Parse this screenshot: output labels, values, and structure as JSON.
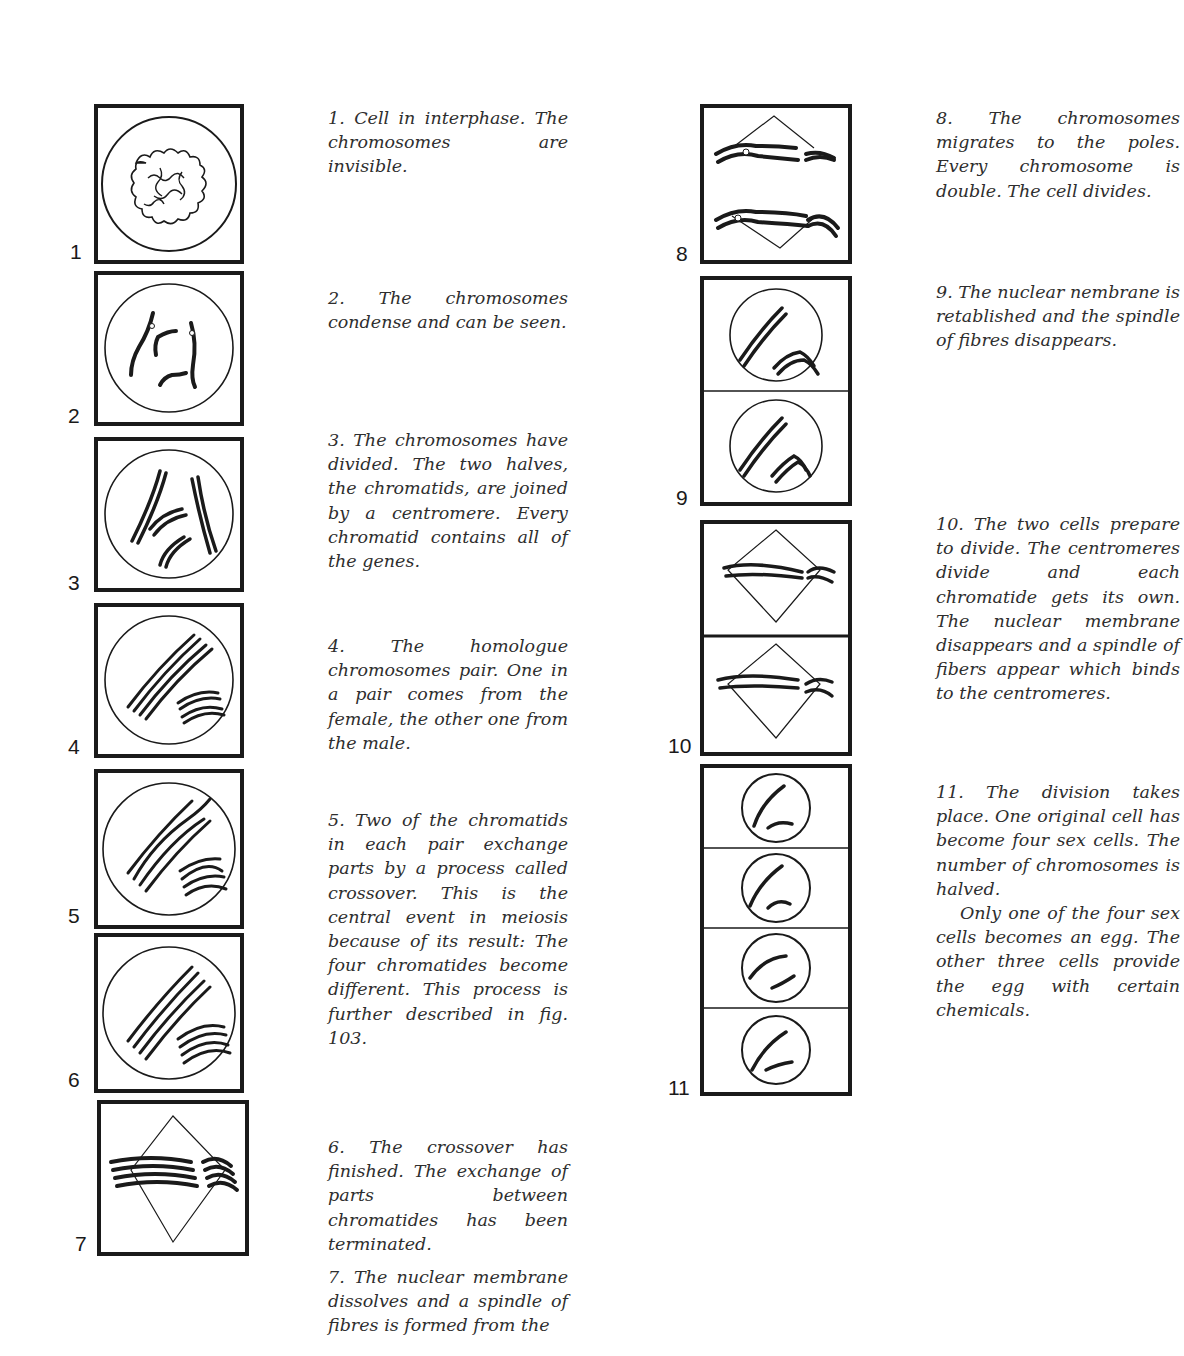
{
  "figure": {
    "stages": [
      {
        "number": "1",
        "caption": "1. Cell in interphase. The chromosomes are invisible."
      },
      {
        "number": "2",
        "caption": "2. The chromosomes condense and can be seen."
      },
      {
        "number": "3",
        "caption": "3. The chromosomes have divided. The two halves, the chromatids, are joined by a centromere. Every chromatid contains all of the genes."
      },
      {
        "number": "4",
        "caption": "4. The homologue chromosomes pair. One in a pair comes from the female, the other one from the male."
      },
      {
        "number": "5",
        "caption": "5. Two of the chromatids in each pair exchange parts by a process called crossover. This is the central event in meiosis because of its result: The four chromatides become different. This process is further described in fig. 103."
      },
      {
        "number": "6",
        "caption": "6. The crossover has finished. The exchange of parts between chromatides has been terminated."
      },
      {
        "number": "7",
        "caption": "7. The nuclear membrane dissolves and a spindle of fibres is formed from the"
      },
      {
        "number": "8",
        "caption": "8. The chromosomes migrates to the poles. Every chromosome is double. The cell divides."
      },
      {
        "number": "9",
        "caption": "9. The nuclear nembrane is retablished and the spindle of fibres disappears."
      },
      {
        "number": "10",
        "caption": "10. The two cells prepare to divide. The centromeres divide and each chromatide gets its own. The nuclear membrane disappears and a spindle of fibers appear which binds to the centromeres."
      },
      {
        "number": "11",
        "caption": "11. The division takes place. One original cell has become four sex cells. The number of chromosomes is halved.",
        "caption_2": "Only one of the four sex cells becomes an egg. The other three cells provide the egg with certain chemicals."
      }
    ]
  }
}
